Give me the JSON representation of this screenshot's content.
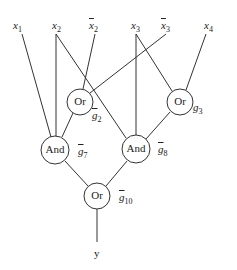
{
  "inputs": [
    {
      "id": "x1",
      "base": "x",
      "sub": "1",
      "negated": false
    },
    {
      "id": "x2",
      "base": "x",
      "sub": "2",
      "negated": false
    },
    {
      "id": "x2bar",
      "base": "x",
      "sub": "2",
      "negated": true
    },
    {
      "id": "x3",
      "base": "x",
      "sub": "3",
      "negated": false
    },
    {
      "id": "x3bar",
      "base": "x",
      "sub": "3",
      "negated": true
    },
    {
      "id": "x4",
      "base": "x",
      "sub": "4",
      "negated": false
    }
  ],
  "gates": [
    {
      "id": "g2",
      "type": "Or",
      "label_base": "g",
      "label_sub": "2",
      "negated": true
    },
    {
      "id": "g3",
      "type": "Or",
      "label_base": "g",
      "label_sub": "3",
      "negated": false
    },
    {
      "id": "g7",
      "type": "And",
      "label_base": "g",
      "label_sub": "7",
      "negated": true
    },
    {
      "id": "g8",
      "type": "And",
      "label_base": "g",
      "label_sub": "8",
      "negated": true
    },
    {
      "id": "g10",
      "type": "Or",
      "label_base": "g",
      "label_sub": "10",
      "negated": true
    }
  ],
  "edges": [
    [
      "x1",
      "g7"
    ],
    [
      "x2",
      "g7"
    ],
    [
      "x2",
      "g8"
    ],
    [
      "x2bar",
      "g2"
    ],
    [
      "x3",
      "g8"
    ],
    [
      "x3",
      "g3"
    ],
    [
      "x3bar",
      "g2"
    ],
    [
      "x4",
      "g3"
    ],
    [
      "g2",
      "g7"
    ],
    [
      "g3",
      "g8"
    ],
    [
      "g7",
      "g10"
    ],
    [
      "g8",
      "g10"
    ],
    [
      "g10",
      "y"
    ]
  ],
  "output": {
    "label": "y"
  }
}
